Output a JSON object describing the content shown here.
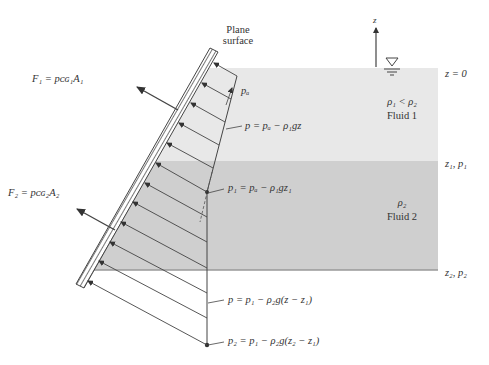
{
  "figure": {
    "labels": {
      "plane_surface_line1": "Plane",
      "plane_surface_line2": "surface",
      "z_axis": "z",
      "z0": "z = 0",
      "z1p1": "z₁, p₁",
      "z2p2": "z₂, p₂",
      "fluid1_density": "ρ₁ < ρ₂",
      "fluid1_name": "Fluid 1",
      "fluid2_density": "ρ₂",
      "fluid2_name": "Fluid 2",
      "pa": "pₐ",
      "eq_fluid1": "p = pₐ − ρ₁gz",
      "eq_p1": "p₁ = pₐ − ρ₁gz₁",
      "eq_fluid2": "p = p₁ − ρ₂g(z − z₁)",
      "eq_p2": "p₂ = p₁ − ρ₂g(z₂ − z₁)",
      "force1": "F₁ = pᴄɢ₁A₁",
      "force2": "F₂ = pᴄɢ₂A₂"
    },
    "colors": {
      "fluid1": "#e8e8e8",
      "fluid2": "#cfcfcf",
      "line": "#444444",
      "hatch": "#555555"
    }
  }
}
